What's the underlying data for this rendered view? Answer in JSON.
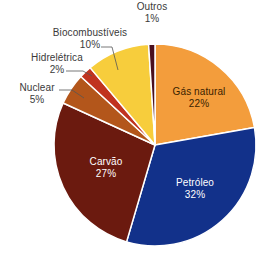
{
  "chart_data": {
    "type": "pie",
    "title": "",
    "start_angle_deg": 0,
    "direction": "clockwise",
    "center": [
      155,
      145
    ],
    "radius": 101,
    "slices": [
      {
        "label": "Gás natural",
        "value": 22,
        "pct_label": "22%",
        "color": "#f39d3c",
        "label_pos": "inside",
        "text_color": "#3a2200"
      },
      {
        "label": "Petróleo",
        "value": 32,
        "pct_label": "32%",
        "color": "#12318a",
        "label_pos": "inside",
        "text_color": "#ffffff"
      },
      {
        "label": "Carvão",
        "value": 27,
        "pct_label": "27%",
        "color": "#6b1a0f",
        "label_pos": "inside",
        "text_color": "#ffffff"
      },
      {
        "label": "Nuclear",
        "value": 5,
        "pct_label": "5%",
        "color": "#b3561b",
        "label_pos": "outside",
        "text_color": "#3a3a3a"
      },
      {
        "label": "Hidrelétrica",
        "value": 2,
        "pct_label": "2%",
        "color": "#c0331f",
        "label_pos": "outside",
        "text_color": "#3a3a3a"
      },
      {
        "label": "Biocombustíveis",
        "value": 10,
        "pct_label": "10%",
        "color": "#f7cd3c",
        "label_pos": "outside",
        "text_color": "#3a3a3a"
      },
      {
        "label": "Outros",
        "value": 1,
        "pct_label": "1%",
        "color": "#4a0f1e",
        "label_pos": "outside",
        "text_color": "#3a3a3a"
      }
    ],
    "legend": "none",
    "grid": false
  },
  "labels": {
    "gas_natural": {
      "name": "Gás natural",
      "pct": "22%"
    },
    "petroleo": {
      "name": "Petróleo",
      "pct": "32%"
    },
    "carvao": {
      "name": "Carvão",
      "pct": "27%"
    },
    "nuclear": {
      "name": "Nuclear",
      "pct": "5%"
    },
    "hidreletrica": {
      "name": "Hidrelétrica",
      "pct": "2%"
    },
    "biocombustiveis": {
      "name": "Biocombustíveis",
      "pct": "10%"
    },
    "outros": {
      "name": "Outros",
      "pct": "1%"
    }
  }
}
